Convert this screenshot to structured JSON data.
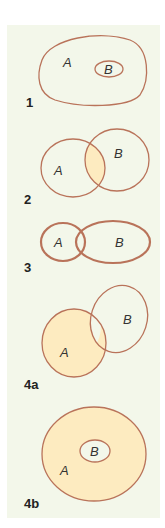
{
  "colors": {
    "background": "#ffffff",
    "panel": "#f3f7ea",
    "outline": "#b9735a",
    "fill": "#fdebc0"
  },
  "diagrams": [
    {
      "number": "1",
      "label_a": "A",
      "label_b": "B",
      "relation": "B subset of A"
    },
    {
      "number": "2",
      "label_a": "A",
      "label_b": "B",
      "relation": "A intersect B (shaded)"
    },
    {
      "number": "3",
      "label_a": "A",
      "label_b": "B",
      "relation": "A and B overlapping (bold outlines)"
    },
    {
      "number": "4a",
      "label_a": "A",
      "label_b": "B",
      "relation": "A shaded, overlaps B"
    },
    {
      "number": "4b",
      "label_a": "A",
      "label_b": "B",
      "relation": "A shaded, B subset of A"
    }
  ]
}
